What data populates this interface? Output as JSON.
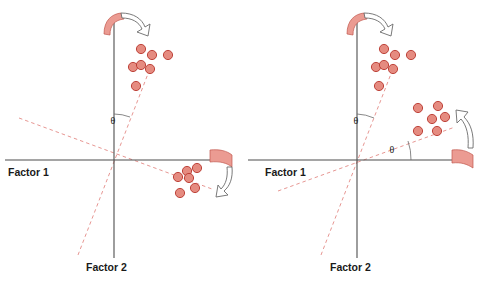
{
  "figure": {
    "colors": {
      "dot_fill": "#e58b80",
      "dot_stroke": "#b8352c",
      "band_fill": "#eb9b92",
      "band_stroke": "#c2584e",
      "axis": "#4d4d4d",
      "rotated_axis": "#e38a86",
      "text": "#1a1a1a"
    },
    "panels": [
      {
        "id": "left",
        "name": "unrotated-solution",
        "origin": {
          "x": 114,
          "y": 160
        },
        "axes": {
          "factor1": {
            "label": "Factor 1",
            "label_pos": {
              "x": 8,
              "y": 172
            },
            "line": {
              "x1": 5,
              "y1": 160,
              "x2": 215,
              "y2": 160
            }
          },
          "factor2": {
            "label": "Factor 2",
            "label_pos": {
              "x": 86,
              "y": 268
            },
            "line": {
              "x1": 114,
              "y1": 22,
              "x2": 114,
              "y2": 258
            }
          }
        },
        "rotated_axes": [
          {
            "name": "rotated-factor-2",
            "x1": 78,
            "y1": 255,
            "x2": 151,
            "y2": 66
          },
          {
            "name": "rotated-factor-1",
            "x1": 19,
            "y1": 118,
            "x2": 212,
            "y2": 189
          }
        ],
        "theta": {
          "symbol": "θ",
          "pos": {
            "x": 117,
            "y": 122
          },
          "arc": {
            "cx": 114,
            "cy": 160,
            "r": 46,
            "from_deg": 90,
            "to_deg": 69
          }
        },
        "clusters": [
          {
            "name": "cluster-upper-right",
            "points": [
              {
                "x": 141,
                "y": 49
              },
              {
                "x": 152,
                "y": 55
              },
              {
                "x": 168,
                "y": 55
              },
              {
                "x": 133,
                "y": 67
              },
              {
                "x": 141,
                "y": 65
              },
              {
                "x": 150,
                "y": 69
              },
              {
                "x": 136,
                "y": 86
              }
            ]
          },
          {
            "name": "cluster-lower-right",
            "points": [
              {
                "x": 187,
                "y": 171
              },
              {
                "x": 197,
                "y": 168
              },
              {
                "x": 178,
                "y": 177
              },
              {
                "x": 189,
                "y": 178
              },
              {
                "x": 195,
                "y": 188
              },
              {
                "x": 180,
                "y": 193
              }
            ]
          }
        ],
        "rotation_arrows": [
          {
            "name": "rotation-arrow-top",
            "band_pos": {
              "x": 108,
              "y": 18
            },
            "direction": "clockwise"
          },
          {
            "name": "rotation-arrow-right",
            "band_pos": {
              "x": 213,
              "y": 148
            },
            "direction": "clockwise"
          }
        ]
      },
      {
        "id": "right",
        "name": "rotated-solution",
        "origin": {
          "x": 357,
          "y": 160
        },
        "axes": {
          "factor1": {
            "label": "Factor 1",
            "label_pos": {
              "x": 265,
              "y": 172
            },
            "line": {
              "x1": 248,
              "y1": 160,
              "x2": 468,
              "y2": 160
            }
          },
          "factor2": {
            "label": "Factor 2",
            "label_pos": {
              "x": 330,
              "y": 268
            },
            "line": {
              "x1": 357,
              "y1": 22,
              "x2": 357,
              "y2": 258
            }
          }
        },
        "rotated_axes": [
          {
            "name": "rotated-factor-2",
            "x1": 321,
            "y1": 255,
            "x2": 394,
            "y2": 66
          },
          {
            "name": "rotated-factor-1",
            "x1": 278,
            "y1": 191,
            "x2": 455,
            "y2": 127
          }
        ],
        "thetas": [
          {
            "symbol": "θ",
            "pos": {
              "x": 360,
              "y": 122
            },
            "arc": {
              "cx": 357,
              "cy": 160,
              "r": 46,
              "from_deg": 90,
              "to_deg": 69
            }
          },
          {
            "symbol": "θ",
            "pos": {
              "x": 389,
              "y": 150
            },
            "arc": {
              "cx": 357,
              "cy": 160,
              "r": 54,
              "from_deg": 0,
              "to_deg": 20
            }
          }
        ],
        "clusters": [
          {
            "name": "cluster-upper-right",
            "points": [
              {
                "x": 384,
                "y": 49
              },
              {
                "x": 395,
                "y": 55
              },
              {
                "x": 411,
                "y": 55
              },
              {
                "x": 376,
                "y": 67
              },
              {
                "x": 384,
                "y": 65
              },
              {
                "x": 393,
                "y": 69
              },
              {
                "x": 379,
                "y": 86
              }
            ]
          },
          {
            "name": "cluster-right",
            "points": [
              {
                "x": 418,
                "y": 108
              },
              {
                "x": 438,
                "y": 106
              },
              {
                "x": 432,
                "y": 119
              },
              {
                "x": 445,
                "y": 117
              },
              {
                "x": 418,
                "y": 131
              },
              {
                "x": 437,
                "y": 131
              }
            ]
          }
        ],
        "rotation_arrows": [
          {
            "name": "rotation-arrow-top",
            "band_pos": {
              "x": 351,
              "y": 18
            },
            "direction": "clockwise"
          },
          {
            "name": "rotation-arrow-right",
            "band_pos": {
              "x": 455,
              "y": 150
            },
            "direction": "counter-clockwise"
          }
        ]
      }
    ]
  }
}
